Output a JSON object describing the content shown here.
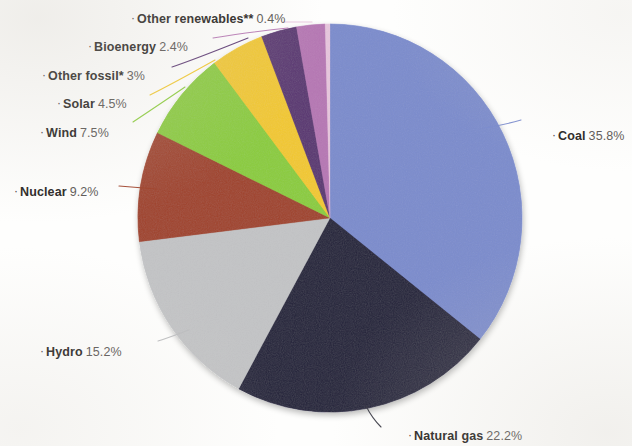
{
  "chart_data": {
    "type": "pie",
    "title": "",
    "subtitle": "",
    "xlabel": "",
    "ylabel": "",
    "legend_position": "callout-labels",
    "grid": false,
    "units": "percent",
    "total": 100,
    "categories": [
      "Coal",
      "Natural gas",
      "Hydro",
      "Nuclear",
      "Wind",
      "Solar",
      "Other fossil*",
      "Bioenergy",
      "Other renewables**"
    ],
    "values": [
      35.8,
      22.2,
      15.2,
      9.2,
      7.5,
      4.5,
      3.0,
      2.4,
      0.4
    ],
    "value_labels": [
      "35.8%",
      "22.2%",
      "15.2%",
      "9.2%",
      "7.5%",
      "4.5%",
      "3%",
      "2.4%",
      "0.4%"
    ],
    "colors": [
      "#7b8ccd",
      "#22203a",
      "#c3c4c6",
      "#a0432c",
      "#8bcc3c",
      "#f2c82e",
      "#5a3672",
      "#b677b4",
      "#e7c6dd"
    ],
    "slices": [
      {
        "id": "coal",
        "label": "Coal",
        "value": 35.8,
        "value_label": "35.8%",
        "color": "#7b8ccd",
        "label_side": "right",
        "label_x": 552,
        "label_y": 130,
        "leader": "M 484,128 C 497,126 511,123 521,120"
      },
      {
        "id": "natural-gas",
        "label": "Natural gas",
        "value": 22.2,
        "value_label": "22.2%",
        "color": "#22203a",
        "label_side": "right",
        "label_x": 408,
        "label_y": 430,
        "leader": "M 366,406 C 370,414 375,421 381,427"
      },
      {
        "id": "hydro",
        "label": "Hydro",
        "value": 15.2,
        "value_label": "15.2%",
        "color": "#c3c4c6",
        "label_side": "left",
        "label_x": 40,
        "label_y": 346,
        "leader": "M 189,330 C 178,334 168,338 158,341"
      },
      {
        "id": "nuclear",
        "label": "Nuclear",
        "value": 9.2,
        "value_label": "9.2%",
        "color": "#a0432c",
        "label_side": "left",
        "label_x": 14,
        "label_y": 186,
        "leader": "M 156,189 C 143,188 130,187 119,186"
      },
      {
        "id": "wind",
        "label": "Wind",
        "value": 7.5,
        "value_label": "7.5%",
        "color": "#8bcc3c",
        "label_side": "left",
        "label_x": 40,
        "label_y": 127,
        "leader": "M 185,87 C 166,100 148,112 133,122"
      },
      {
        "id": "solar",
        "label": "Solar",
        "value": 4.5,
        "value_label": "4.5%",
        "color": "#f2c82e",
        "label_side": "left",
        "label_x": 57,
        "label_y": 98,
        "leader": "M 215,60 C 190,74 168,86 150,95"
      },
      {
        "id": "other-fossil",
        "label": "Other fossil*",
        "value": 3.0,
        "value_label": "3%",
        "color": "#5a3672",
        "label_side": "left",
        "label_x": 42,
        "label_y": 70,
        "leader": "M 248,38 C 218,50 193,60 172,67"
      },
      {
        "id": "bioenergy",
        "label": "Bioenergy",
        "value": 2.4,
        "value_label": "2.4%",
        "color": "#b677b4",
        "label_side": "left",
        "label_x": 88,
        "label_y": 41,
        "leader": "M 288,28 C 258,31 232,35 213,38"
      },
      {
        "id": "other-renewables",
        "label": "Other renewables**",
        "value": 0.4,
        "value_label": "0.4%",
        "color": "#e7c6dd",
        "label_side": "left",
        "label_x": 131,
        "label_y": 13,
        "leader": "M 312,22 C 300,22 290,22 283,22"
      }
    ],
    "footnotes": [
      "*",
      "**"
    ]
  }
}
